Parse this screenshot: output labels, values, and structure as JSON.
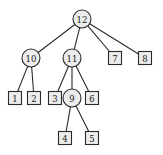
{
  "figure": {
    "background_color": "#ffffff",
    "stroke_color": "#2b2b2b",
    "node_fill_color": "#ececec",
    "label_color": "#1a1a1a"
  },
  "chart_data": {
    "type": "diagram",
    "diagram_kind": "tree",
    "root": "12",
    "nodes": [
      {
        "id": "12",
        "label": "12",
        "shape": "circle",
        "cx": 82,
        "cy": 19,
        "r": 9,
        "depth": 0
      },
      {
        "id": "10",
        "label": "10",
        "shape": "circle",
        "cx": 31,
        "cy": 58,
        "r": 9,
        "depth": 1
      },
      {
        "id": "11",
        "label": "11",
        "shape": "circle",
        "cx": 72,
        "cy": 58,
        "r": 9,
        "depth": 1
      },
      {
        "id": "7",
        "label": "7",
        "shape": "square",
        "cx": 115,
        "cy": 58,
        "size": 13,
        "depth": 1
      },
      {
        "id": "8",
        "label": "8",
        "shape": "square",
        "cx": 145,
        "cy": 58,
        "size": 13,
        "depth": 1
      },
      {
        "id": "1",
        "label": "1",
        "shape": "square",
        "cx": 15,
        "cy": 98,
        "size": 13,
        "depth": 2
      },
      {
        "id": "2",
        "label": "2",
        "shape": "square",
        "cx": 34,
        "cy": 98,
        "size": 13,
        "depth": 2
      },
      {
        "id": "3",
        "label": "3",
        "shape": "square",
        "cx": 55,
        "cy": 98,
        "size": 13,
        "depth": 2
      },
      {
        "id": "9",
        "label": "9",
        "shape": "circle",
        "cx": 72,
        "cy": 98,
        "r": 9,
        "depth": 2
      },
      {
        "id": "6",
        "label": "6",
        "shape": "square",
        "cx": 92,
        "cy": 98,
        "size": 13,
        "depth": 2
      },
      {
        "id": "4",
        "label": "4",
        "shape": "square",
        "cx": 65,
        "cy": 138,
        "size": 13,
        "depth": 3
      },
      {
        "id": "5",
        "label": "5",
        "shape": "square",
        "cx": 92,
        "cy": 138,
        "size": 13,
        "depth": 3
      }
    ],
    "edges": [
      {
        "from": "12",
        "to": "10"
      },
      {
        "from": "12",
        "to": "11"
      },
      {
        "from": "12",
        "to": "7"
      },
      {
        "from": "12",
        "to": "8"
      },
      {
        "from": "10",
        "to": "1"
      },
      {
        "from": "10",
        "to": "2"
      },
      {
        "from": "11",
        "to": "3"
      },
      {
        "from": "11",
        "to": "9"
      },
      {
        "from": "11",
        "to": "6"
      },
      {
        "from": "9",
        "to": "4"
      },
      {
        "from": "9",
        "to": "5"
      }
    ],
    "node_labels": [
      "12",
      "10",
      "11",
      "7",
      "8",
      "1",
      "2",
      "3",
      "9",
      "6",
      "4",
      "5"
    ],
    "leaf_labels": [
      "7",
      "8",
      "1",
      "2",
      "3",
      "6",
      "4",
      "5"
    ],
    "internal_labels": [
      "12",
      "10",
      "11",
      "9"
    ],
    "legend": {
      "circle_meaning": "internal node",
      "square_meaning": "leaf node"
    }
  }
}
